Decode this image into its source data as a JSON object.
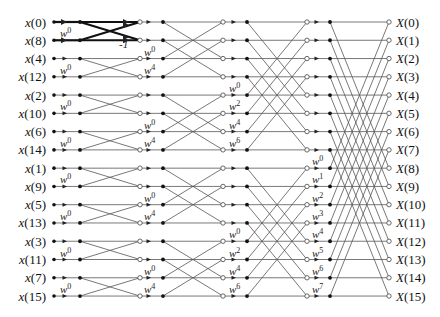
{
  "colors": {
    "line": "#555555",
    "bold_line": "#111111",
    "text": "#111111",
    "background": "#ffffff"
  },
  "inputs": [
    "x(0)",
    "x(8)",
    "x(4)",
    "x(12)",
    "x(2)",
    "x(10)",
    "x(6)",
    "x(14)",
    "x(1)",
    "x(9)",
    "x(5)",
    "x(13)",
    "x(3)",
    "x(11)",
    "x(7)",
    "x(15)"
  ],
  "outputs": [
    "X(0)",
    "X(1)",
    "X(2)",
    "X(3)",
    "X(4)",
    "X(5)",
    "X(6)",
    "X(7)",
    "X(8)",
    "X(9)",
    "X(10)",
    "X(11)",
    "X(12)",
    "X(13)",
    "X(14)",
    "X(15)"
  ],
  "stages": [
    {
      "span": 1,
      "twiddles": [
        {
          "row": 1,
          "label": "w",
          "exp": "0"
        },
        {
          "row": 3,
          "label": "w",
          "exp": "0"
        },
        {
          "row": 5,
          "label": "w",
          "exp": "0"
        },
        {
          "row": 7,
          "label": "w",
          "exp": "0"
        },
        {
          "row": 9,
          "label": "w",
          "exp": "0"
        },
        {
          "row": 11,
          "label": "w",
          "exp": "0"
        },
        {
          "row": 13,
          "label": "w",
          "exp": "0"
        },
        {
          "row": 15,
          "label": "w",
          "exp": "0"
        }
      ]
    },
    {
      "span": 2,
      "twiddles": [
        {
          "row": 2,
          "label": "w",
          "exp": "0"
        },
        {
          "row": 3,
          "label": "w",
          "exp": "4"
        },
        {
          "row": 6,
          "label": "w",
          "exp": "0"
        },
        {
          "row": 7,
          "label": "w",
          "exp": "4"
        },
        {
          "row": 10,
          "label": "w",
          "exp": "0"
        },
        {
          "row": 11,
          "label": "w",
          "exp": "4"
        },
        {
          "row": 14,
          "label": "w",
          "exp": "0"
        },
        {
          "row": 15,
          "label": "w",
          "exp": "4"
        }
      ]
    },
    {
      "span": 4,
      "twiddles": [
        {
          "row": 4,
          "label": "w",
          "exp": "0"
        },
        {
          "row": 5,
          "label": "w",
          "exp": "2"
        },
        {
          "row": 6,
          "label": "w",
          "exp": "4"
        },
        {
          "row": 7,
          "label": "w",
          "exp": "6"
        },
        {
          "row": 12,
          "label": "w",
          "exp": "0"
        },
        {
          "row": 13,
          "label": "w",
          "exp": "2"
        },
        {
          "row": 14,
          "label": "w",
          "exp": "4"
        },
        {
          "row": 15,
          "label": "w",
          "exp": "6"
        }
      ]
    },
    {
      "span": 8,
      "twiddles": [
        {
          "row": 8,
          "label": "w",
          "exp": "0"
        },
        {
          "row": 9,
          "label": "w",
          "exp": "1"
        },
        {
          "row": 10,
          "label": "w",
          "exp": "2"
        },
        {
          "row": 11,
          "label": "w",
          "exp": "3"
        },
        {
          "row": 12,
          "label": "w",
          "exp": "4"
        },
        {
          "row": 13,
          "label": "w",
          "exp": "5"
        },
        {
          "row": 14,
          "label": "w",
          "exp": "6"
        },
        {
          "row": 15,
          "label": "w",
          "exp": "7"
        }
      ]
    }
  ],
  "highlight": {
    "stage": 0,
    "rows": [
      0,
      1
    ],
    "minus_one_label": "-1"
  },
  "layout": {
    "row_y0": 22,
    "row_dy": 18.27,
    "input_label_right": 46,
    "stage_x": [
      {
        "dot1": 54,
        "arrow": 66,
        "dot2": 80,
        "end": 140
      },
      {
        "dot1": 140,
        "arrow": 150,
        "dot2": 163,
        "end": 223
      },
      {
        "dot1": 223,
        "arrow": 235,
        "dot2": 247,
        "end": 307
      },
      {
        "dot1": 307,
        "arrow": 318,
        "dot2": 330,
        "end": 389
      }
    ],
    "output_label_left": 396
  }
}
